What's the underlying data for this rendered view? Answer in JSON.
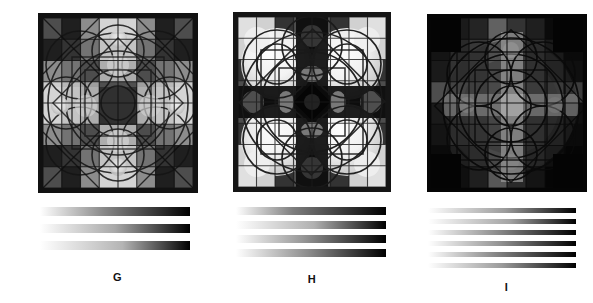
{
  "figure": {
    "background_color": "#ffffff",
    "panel_count": 3,
    "caption_style": "single uppercase letter beneath each panel"
  },
  "panels": [
    {
      "id": "G",
      "label": "G",
      "art": {
        "name": "mandala-pattern-g",
        "description": "Square grayscale mandala with a bright cross/plus of light cells through the center, dark corner quadrants, overlapping circle and square outlines, and a thick dark border frame.",
        "x": 35,
        "y": 13,
        "width": 160,
        "height": 180,
        "border_color": "#1a1a1a",
        "border_px": 5,
        "grid": 8,
        "symmetry": "4-fold cross (plus-shaped bright axis)",
        "mean_luminance": 0.46,
        "cell_values": [
          [
            0.3,
            0.12,
            0.55,
            0.8,
            0.8,
            0.55,
            0.12,
            0.3
          ],
          [
            0.12,
            0.2,
            0.45,
            0.72,
            0.72,
            0.45,
            0.2,
            0.12
          ],
          [
            0.55,
            0.45,
            0.3,
            0.62,
            0.62,
            0.3,
            0.45,
            0.55
          ],
          [
            0.8,
            0.72,
            0.62,
            0.18,
            0.18,
            0.62,
            0.72,
            0.8
          ],
          [
            0.8,
            0.72,
            0.62,
            0.18,
            0.18,
            0.62,
            0.72,
            0.8
          ],
          [
            0.55,
            0.45,
            0.3,
            0.62,
            0.62,
            0.3,
            0.45,
            0.55
          ],
          [
            0.12,
            0.2,
            0.45,
            0.72,
            0.72,
            0.45,
            0.2,
            0.12
          ],
          [
            0.3,
            0.12,
            0.55,
            0.8,
            0.8,
            0.55,
            0.12,
            0.3
          ]
        ]
      },
      "ramps": {
        "name": "gradient-ramps-g",
        "count": 3,
        "x": 40,
        "y": 207,
        "width": 150,
        "bar_height": 9,
        "bar_gap": 8,
        "direction": "left-to-right, white to black",
        "bars": [
          {
            "index": 1,
            "start": "#ffffff",
            "mid": "#8a8a8a",
            "end": "#000000",
            "midpoint_pct": 42
          },
          {
            "index": 2,
            "start": "#ffffff",
            "mid": "#a8a8a8",
            "end": "#000000",
            "midpoint_pct": 50
          },
          {
            "index": 3,
            "start": "#ffffff",
            "mid": "#b4b4b4",
            "end": "#000000",
            "midpoint_pct": 55
          }
        ]
      }
    },
    {
      "id": "H",
      "label": "H",
      "art": {
        "name": "mandala-pattern-h",
        "description": "Square grayscale mandala with a bright X / diagonal saltire of very light circular blobs in the four quadrants, dark vertical and horizontal bands, a small dark diamond at center, and a thick dark border frame.",
        "x": 224,
        "y": 12,
        "width": 158,
        "height": 180,
        "border_color": "#1a1a1a",
        "border_px": 5,
        "grid": 8,
        "symmetry": "4-fold diagonal (X-shaped bright axis)",
        "mean_luminance": 0.42,
        "cell_values": [
          [
            0.88,
            0.82,
            0.2,
            0.3,
            0.3,
            0.2,
            0.82,
            0.88
          ],
          [
            0.82,
            0.9,
            0.7,
            0.15,
            0.15,
            0.7,
            0.9,
            0.82
          ],
          [
            0.2,
            0.7,
            0.86,
            0.4,
            0.4,
            0.86,
            0.7,
            0.2
          ],
          [
            0.3,
            0.15,
            0.4,
            0.22,
            0.22,
            0.4,
            0.15,
            0.3
          ],
          [
            0.3,
            0.15,
            0.4,
            0.22,
            0.22,
            0.4,
            0.15,
            0.3
          ],
          [
            0.2,
            0.7,
            0.86,
            0.4,
            0.4,
            0.86,
            0.7,
            0.2
          ],
          [
            0.82,
            0.9,
            0.7,
            0.15,
            0.15,
            0.7,
            0.9,
            0.82
          ],
          [
            0.88,
            0.82,
            0.2,
            0.3,
            0.3,
            0.2,
            0.82,
            0.88
          ]
        ]
      },
      "ramps": {
        "name": "gradient-ramps-h",
        "count": 4,
        "x": 232,
        "y": 207,
        "width": 150,
        "bar_height": 8,
        "bar_gap": 6,
        "direction": "left-to-right, white to black",
        "bars": [
          {
            "index": 1,
            "start": "#ffffff",
            "mid": "#7e7e7e",
            "end": "#000000",
            "midpoint_pct": 38
          },
          {
            "index": 2,
            "start": "#ffffff",
            "mid": "#b0b0b0",
            "end": "#000000",
            "midpoint_pct": 52
          },
          {
            "index": 3,
            "start": "#ffffff",
            "mid": "#969696",
            "end": "#000000",
            "midpoint_pct": 45
          },
          {
            "index": 4,
            "start": "#ffffff",
            "mid": "#8c8c8c",
            "end": "#000000",
            "midpoint_pct": 48
          }
        ]
      }
    },
    {
      "id": "I",
      "label": "I",
      "art": {
        "name": "mandala-pattern-i",
        "description": "Square very dark grayscale mandala with an off-centre bright vertical bar and horizontal bar forming a dim cross, faint concentric circle outlines, black corners and no light border frame.",
        "x": 413,
        "y": 14,
        "width": 160,
        "height": 178,
        "border_color": "#050505",
        "border_px": 4,
        "grid": 8,
        "symmetry": "off-centre cross, low contrast",
        "mean_luminance": 0.18,
        "cell_values": [
          [
            0.02,
            0.1,
            0.14,
            0.38,
            0.2,
            0.12,
            0.04,
            0.02
          ],
          [
            0.08,
            0.16,
            0.22,
            0.46,
            0.26,
            0.18,
            0.1,
            0.04
          ],
          [
            0.1,
            0.2,
            0.26,
            0.5,
            0.3,
            0.22,
            0.12,
            0.06
          ],
          [
            0.3,
            0.36,
            0.4,
            0.56,
            0.42,
            0.36,
            0.3,
            0.24
          ],
          [
            0.1,
            0.2,
            0.28,
            0.5,
            0.32,
            0.22,
            0.12,
            0.06
          ],
          [
            0.08,
            0.18,
            0.24,
            0.46,
            0.28,
            0.18,
            0.1,
            0.04
          ],
          [
            0.04,
            0.12,
            0.18,
            0.4,
            0.22,
            0.14,
            0.06,
            0.02
          ],
          [
            0.02,
            0.06,
            0.12,
            0.34,
            0.16,
            0.08,
            0.02,
            0.02
          ]
        ]
      },
      "ramps": {
        "name": "gradient-ramps-i",
        "count": 6,
        "x": 422,
        "y": 207,
        "width": 148,
        "bar_height": 5,
        "bar_gap": 6,
        "direction": "left-to-right, white to black",
        "bars": [
          {
            "index": 1,
            "start": "#ffffff",
            "mid": "#9c9c9c",
            "end": "#000000",
            "midpoint_pct": 52
          },
          {
            "index": 2,
            "start": "#ffffff",
            "mid": "#a4a4a4",
            "end": "#000000",
            "midpoint_pct": 55
          },
          {
            "index": 3,
            "start": "#ffffff",
            "mid": "#8e8e8e",
            "end": "#000000",
            "midpoint_pct": 46
          },
          {
            "index": 4,
            "start": "#ffffff",
            "mid": "#949494",
            "end": "#000000",
            "midpoint_pct": 48
          },
          {
            "index": 5,
            "start": "#ffffff",
            "mid": "#8a8a8a",
            "end": "#000000",
            "midpoint_pct": 44
          },
          {
            "index": 6,
            "start": "#ffffff",
            "mid": "#9a9a9a",
            "end": "#000000",
            "midpoint_pct": 50
          }
        ]
      }
    }
  ]
}
